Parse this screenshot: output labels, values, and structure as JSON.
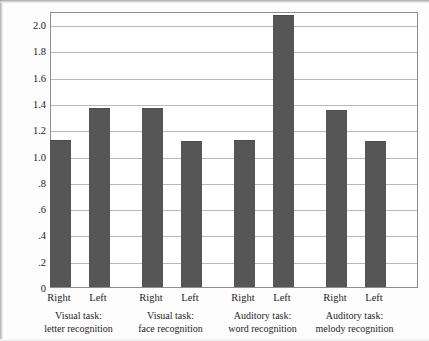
{
  "chart_data": {
    "type": "bar",
    "title": "",
    "subtitle": "",
    "xlabel": "",
    "ylabel": "Performance ratio",
    "ylim": [
      0,
      2.1
    ],
    "grid": "horizontal",
    "legend": "none",
    "bar_color": "#565656",
    "frame_color": "#8d8d8d",
    "gridline_color": "#b9b9b9",
    "ytick_labels": [
      "0",
      ".2",
      ".4",
      ".6",
      ".8",
      "1.0",
      "1.2",
      "1.4",
      "1.6",
      "1.8",
      "2.0"
    ],
    "ytick_values": [
      0,
      0.2,
      0.4,
      0.6,
      0.8,
      1.0,
      1.2,
      1.4,
      1.6,
      1.8,
      2.0
    ],
    "categories": [
      "Right",
      "Left",
      "Right",
      "Left",
      "Right",
      "Left",
      "Right",
      "Left"
    ],
    "values": [
      1.12,
      1.36,
      1.36,
      1.11,
      1.12,
      2.07,
      1.35,
      1.11
    ],
    "groups": [
      {
        "line1": "Visual task:",
        "line2": "letter recognition",
        "ears": [
          "Right",
          "Left"
        ],
        "values": [
          1.12,
          1.36
        ]
      },
      {
        "line1": "Visual task:",
        "line2": "face recognition",
        "ears": [
          "Right",
          "Left"
        ],
        "values": [
          1.36,
          1.11
        ]
      },
      {
        "line1": "Auditory task:",
        "line2": "word recognition",
        "ears": [
          "Right",
          "Left"
        ],
        "values": [
          1.12,
          2.07
        ]
      },
      {
        "line1": "Auditory task:",
        "line2": "melody recognition",
        "ears": [
          "Right",
          "Left"
        ],
        "values": [
          1.35,
          1.11
        ]
      }
    ]
  }
}
